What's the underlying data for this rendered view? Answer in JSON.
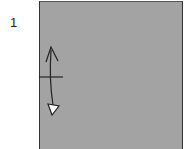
{
  "diagram": {
    "step_number": "1",
    "paper_color": "#a3a3a3",
    "annotations": [
      {
        "type": "crease-mark",
        "description": "short horizontal pinch mark on left edge"
      },
      {
        "type": "fold-unfold-arrow",
        "description": "vertical arrow: fold and unfold"
      }
    ]
  }
}
